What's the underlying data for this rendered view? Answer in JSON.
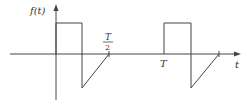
{
  "diagram": {
    "y_axis_label": "f(t)",
    "x_axis_label": "t",
    "tick_labels": {
      "half_period_numerator": "T",
      "half_period_denominator": "2",
      "period": "T"
    },
    "stroke_color": "#444444"
  }
}
